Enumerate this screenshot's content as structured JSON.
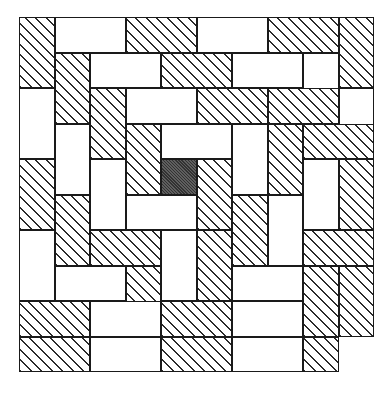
{
  "figure": {
    "width_px": 387,
    "height_px": 397,
    "colors": {
      "background": "#ffffff",
      "tile_fill_plain": "#ffffff",
      "tile_outline": "#1a1a1a",
      "hatch_line": "#2b2b2b",
      "center_square_fill": "#4d4d4d"
    },
    "grid": {
      "origin_x_px": 19,
      "origin_y_px": 17,
      "unit_px": 35.5,
      "columns": 10,
      "rows": 10
    },
    "hatch": {
      "angle_deg": 45,
      "spacing_px": 7.4,
      "line_width_px": 1.3
    },
    "counts": {
      "total_dominoes": 49,
      "hatched_dominoes": 25,
      "plain_dominoes": 24,
      "shaded_unit_squares": 1
    },
    "tiles": [
      {
        "name": "tile-r0c0-v-hatch",
        "x": 0,
        "y": 0,
        "w": 1,
        "h": 2,
        "fill": "hatch"
      },
      {
        "name": "tile-r0c1-h-plain",
        "x": 1,
        "y": 0,
        "w": 2,
        "h": 1,
        "fill": "plain"
      },
      {
        "name": "tile-r0c3-h-hatch",
        "x": 3,
        "y": 0,
        "w": 2,
        "h": 1,
        "fill": "hatch"
      },
      {
        "name": "tile-r0c5-h-plain",
        "x": 5,
        "y": 0,
        "w": 2,
        "h": 1,
        "fill": "plain"
      },
      {
        "name": "tile-r0c7-h-hatch",
        "x": 7,
        "y": 0,
        "w": 2,
        "h": 1,
        "fill": "hatch"
      },
      {
        "name": "tile-r0c9-v-hatch",
        "x": 9,
        "y": 0,
        "w": 1,
        "h": 2,
        "fill": "hatch"
      },
      {
        "name": "tile-r1c1-v-hatch",
        "x": 1,
        "y": 1,
        "w": 1,
        "h": 2,
        "fill": "hatch"
      },
      {
        "name": "tile-r1c2-h-plain",
        "x": 2,
        "y": 1,
        "w": 2,
        "h": 1,
        "fill": "plain"
      },
      {
        "name": "tile-r1c4-h-hatch",
        "x": 4,
        "y": 1,
        "w": 2,
        "h": 1,
        "fill": "hatch"
      },
      {
        "name": "tile-r1c6-h-plain",
        "x": 6,
        "y": 1,
        "w": 2,
        "h": 1,
        "fill": "plain"
      },
      {
        "name": "tile-r1c8-v-plain",
        "x": 8,
        "y": 1,
        "w": 1,
        "h": 2,
        "fill": "plain"
      },
      {
        "name": "tile-r2c0-v-plain",
        "x": 0,
        "y": 2,
        "w": 1,
        "h": 2,
        "fill": "plain"
      },
      {
        "name": "tile-r2c2-v-hatch",
        "x": 2,
        "y": 2,
        "w": 1,
        "h": 2,
        "fill": "hatch"
      },
      {
        "name": "tile-r2c3-h-plain",
        "x": 3,
        "y": 2,
        "w": 2,
        "h": 1,
        "fill": "plain"
      },
      {
        "name": "tile-r2c5-h-hatch",
        "x": 5,
        "y": 2,
        "w": 2,
        "h": 1,
        "fill": "hatch"
      },
      {
        "name": "tile-r2c7-h-hatch",
        "x": 7,
        "y": 2,
        "w": 2,
        "h": 1,
        "fill": "hatch"
      },
      {
        "name": "tile-r2c9-v-plain",
        "x": 9,
        "y": 2,
        "w": 1,
        "h": 2,
        "fill": "plain"
      },
      {
        "name": "tile-r3c1-v-plain",
        "x": 1,
        "y": 3,
        "w": 1,
        "h": 2,
        "fill": "plain"
      },
      {
        "name": "tile-r3c3-v-hatch",
        "x": 3,
        "y": 3,
        "w": 1,
        "h": 2,
        "fill": "hatch"
      },
      {
        "name": "tile-r3c4-h-plain",
        "x": 4,
        "y": 3,
        "w": 2,
        "h": 1,
        "fill": "plain"
      },
      {
        "name": "tile-r3c6-v-plain",
        "x": 6,
        "y": 3,
        "w": 1,
        "h": 2,
        "fill": "plain"
      },
      {
        "name": "tile-r3c7-v-hatch",
        "x": 7,
        "y": 3,
        "w": 1,
        "h": 2,
        "fill": "hatch"
      },
      {
        "name": "tile-r3c8-h-hatch",
        "x": 8,
        "y": 3,
        "w": 2,
        "h": 1,
        "fill": "hatch"
      },
      {
        "name": "tile-r4c0-v-hatch",
        "x": 0,
        "y": 4,
        "w": 1,
        "h": 2,
        "fill": "hatch"
      },
      {
        "name": "tile-r4c2-v-plain",
        "x": 2,
        "y": 4,
        "w": 1,
        "h": 2,
        "fill": "plain"
      },
      {
        "name": "tile-r4c4-center",
        "x": 4,
        "y": 4,
        "w": 1,
        "h": 1,
        "fill": "solid"
      },
      {
        "name": "tile-r4c5-h-hatch",
        "x": 5,
        "y": 4,
        "w": 1,
        "h": 2,
        "fill": "hatch"
      },
      {
        "name": "tile-r4c8-v-plain",
        "x": 8,
        "y": 4,
        "w": 1,
        "h": 2,
        "fill": "plain"
      },
      {
        "name": "tile-r4c9-v-hatch",
        "x": 9,
        "y": 4,
        "w": 1,
        "h": 2,
        "fill": "hatch"
      },
      {
        "name": "tile-r5c1-v-hatch",
        "x": 1,
        "y": 5,
        "w": 1,
        "h": 2,
        "fill": "hatch"
      },
      {
        "name": "tile-r5c3-h-plain",
        "x": 3,
        "y": 5,
        "w": 2,
        "h": 1,
        "fill": "plain"
      },
      {
        "name": "tile-r5c6-v-hatch",
        "x": 6,
        "y": 5,
        "w": 1,
        "h": 2,
        "fill": "hatch"
      },
      {
        "name": "tile-r5c7-v-plain",
        "x": 7,
        "y": 5,
        "w": 1,
        "h": 2,
        "fill": "plain"
      },
      {
        "name": "tile-r6c0-v-plain",
        "x": 0,
        "y": 6,
        "w": 1,
        "h": 2,
        "fill": "plain"
      },
      {
        "name": "tile-r6c2-h-hatch",
        "x": 2,
        "y": 6,
        "w": 2,
        "h": 1,
        "fill": "hatch"
      },
      {
        "name": "tile-r6c4-v-plain",
        "x": 4,
        "y": 6,
        "w": 1,
        "h": 2,
        "fill": "plain"
      },
      {
        "name": "tile-r6c5-h-hatch",
        "x": 5,
        "y": 6,
        "w": 1,
        "h": 2,
        "fill": "hatch"
      },
      {
        "name": "tile-r6c8-h-hatch",
        "x": 8,
        "y": 6,
        "w": 2,
        "h": 1,
        "fill": "hatch"
      },
      {
        "name": "tile-r7c1-h-plain",
        "x": 1,
        "y": 7,
        "w": 2,
        "h": 1,
        "fill": "plain"
      },
      {
        "name": "tile-r7c3-h-hatch",
        "x": 3,
        "y": 7,
        "w": 1,
        "h": 2,
        "fill": "hatch"
      },
      {
        "name": "tile-r7c6-h-plain",
        "x": 6,
        "y": 7,
        "w": 2,
        "h": 1,
        "fill": "plain"
      },
      {
        "name": "tile-r7c8-v-hatch",
        "x": 8,
        "y": 7,
        "w": 1,
        "h": 2,
        "fill": "hatch"
      },
      {
        "name": "tile-r7c9-v-hatch",
        "x": 9,
        "y": 7,
        "w": 1,
        "h": 2,
        "fill": "hatch"
      },
      {
        "name": "tile-r8c0-h-hatch",
        "x": 0,
        "y": 8,
        "w": 2,
        "h": 1,
        "fill": "hatch"
      },
      {
        "name": "tile-r8c2-h-plain",
        "x": 2,
        "y": 8,
        "w": 2,
        "h": 1,
        "fill": "plain"
      },
      {
        "name": "tile-r8c4-h-hatch",
        "x": 4,
        "y": 8,
        "w": 2,
        "h": 1,
        "fill": "hatch"
      },
      {
        "name": "tile-r8c6-h-plain",
        "x": 6,
        "y": 8,
        "w": 2,
        "h": 1,
        "fill": "plain"
      },
      {
        "name": "tile-r9c0-h-hatch",
        "x": 0,
        "y": 9,
        "w": 2,
        "h": 1,
        "fill": "hatch"
      },
      {
        "name": "tile-r9c2-h-plain",
        "x": 2,
        "y": 9,
        "w": 2,
        "h": 1,
        "fill": "plain"
      },
      {
        "name": "tile-r9c4-h-hatch",
        "x": 4,
        "y": 9,
        "w": 2,
        "h": 1,
        "fill": "hatch"
      },
      {
        "name": "tile-r9c6-h-plain",
        "x": 6,
        "y": 9,
        "w": 2,
        "h": 1,
        "fill": "plain"
      },
      {
        "name": "tile-r9c8-h-hatch",
        "x": 8,
        "y": 9,
        "w": 1,
        "h": 1,
        "fill": "hatch"
      }
    ]
  }
}
